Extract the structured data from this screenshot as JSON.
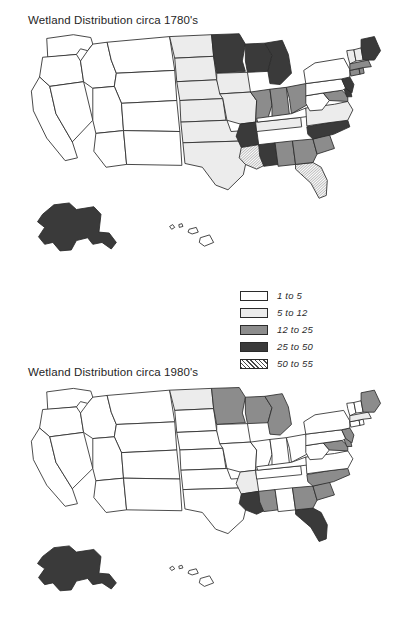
{
  "figure": {
    "background_color": "#ffffff",
    "outline_color": "#2b2b2b"
  },
  "panels": [
    {
      "id": "p1780",
      "title": "Wetland Distribution circa 1780's"
    },
    {
      "id": "p1980",
      "title": "Wetland Distribution circa 1980's"
    }
  ],
  "legend": {
    "position": "center-right-between-maps",
    "entries": [
      {
        "label": "1 to 5",
        "fill": "#ffffff",
        "pattern": "solid"
      },
      {
        "label": "5 to 12",
        "fill": "#ececec",
        "pattern": "solid"
      },
      {
        "label": "12 to 25",
        "fill": "#8c8c8c",
        "pattern": "solid"
      },
      {
        "label": "25 to 50",
        "fill": "#3a3a3a",
        "pattern": "solid"
      },
      {
        "label": "50 to 55",
        "fill": "#ffffff",
        "pattern": "hatch"
      }
    ]
  },
  "chart_data": {
    "type": "choropleth_map_pair",
    "unit": "percent of state area that is wetland",
    "classes": [
      "1 to 5",
      "5 to 12",
      "12 to 25",
      "25 to 50",
      "50 to 55"
    ],
    "class_fills": [
      "#ffffff",
      "#ececec",
      "#8c8c8c",
      "#3a3a3a",
      "hatch"
    ],
    "maps": [
      {
        "name": "circa 1780's",
        "title": "Wetland Distribution circa 1780's",
        "values": {
          "WA": "1 to 5",
          "OR": "1 to 5",
          "CA": "1 to 5",
          "NV": "1 to 5",
          "ID": "1 to 5",
          "MT": "1 to 5",
          "WY": "1 to 5",
          "UT": "1 to 5",
          "AZ": "1 to 5",
          "CO": "1 to 5",
          "NM": "1 to 5",
          "ND": "5 to 12",
          "SD": "5 to 12",
          "NE": "5 to 12",
          "KS": "5 to 12",
          "OK": "5 to 12",
          "TX": "5 to 12",
          "IA": "5 to 12",
          "MO": "5 to 12",
          "MN": "25 to 50",
          "WI": "25 to 50",
          "MI": "25 to 50",
          "IL": "12 to 25",
          "IN": "12 to 25",
          "OH": "12 to 25",
          "KY": "1 to 5",
          "TN": "5 to 12",
          "WV": "1 to 5",
          "VA": "5 to 12",
          "NC": "25 to 50",
          "SC": "12 to 25",
          "GA": "12 to 25",
          "AL": "12 to 25",
          "MS": "25 to 50",
          "AR": "25 to 50",
          "LA": "50 to 55",
          "FL": "50 to 55",
          "PA": "1 to 5",
          "NY": "1 to 5",
          "NJ": "25 to 50",
          "DE": "25 to 50",
          "MD": "12 to 25",
          "CT": "12 to 25",
          "RI": "12 to 25",
          "MA": "12 to 25",
          "VT": "5 to 12",
          "NH": "5 to 12",
          "ME": "25 to 50",
          "AK": "25 to 50",
          "HI": "1 to 5"
        }
      },
      {
        "name": "circa 1980's",
        "title": "Wetland Distribution circa 1980's",
        "values": {
          "WA": "1 to 5",
          "OR": "1 to 5",
          "CA": "1 to 5",
          "NV": "1 to 5",
          "ID": "1 to 5",
          "MT": "1 to 5",
          "WY": "1 to 5",
          "UT": "1 to 5",
          "AZ": "1 to 5",
          "CO": "1 to 5",
          "NM": "1 to 5",
          "ND": "5 to 12",
          "SD": "1 to 5",
          "NE": "1 to 5",
          "KS": "1 to 5",
          "OK": "1 to 5",
          "TX": "1 to 5",
          "IA": "1 to 5",
          "MO": "1 to 5",
          "MN": "12 to 25",
          "WI": "12 to 25",
          "MI": "12 to 25",
          "IL": "1 to 5",
          "IN": "1 to 5",
          "OH": "1 to 5",
          "KY": "1 to 5",
          "TN": "1 to 5",
          "WV": "1 to 5",
          "VA": "1 to 5",
          "NC": "12 to 25",
          "SC": "12 to 25",
          "GA": "12 to 25",
          "AL": "1 to 5",
          "MS": "12 to 25",
          "AR": "5 to 12",
          "LA": "25 to 50",
          "FL": "25 to 50",
          "PA": "1 to 5",
          "NY": "1 to 5",
          "NJ": "12 to 25",
          "DE": "12 to 25",
          "MD": "12 to 25",
          "CT": "1 to 5",
          "RI": "1 to 5",
          "MA": "5 to 12",
          "VT": "1 to 5",
          "NH": "1 to 5",
          "ME": "12 to 25",
          "AK": "25 to 50",
          "HI": "1 to 5"
        }
      }
    ]
  }
}
